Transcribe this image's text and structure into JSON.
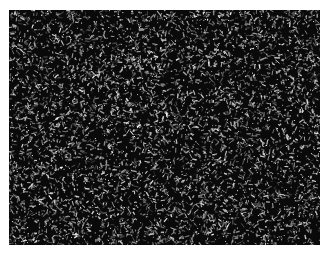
{
  "figure": {
    "colors": {
      "background": "#0a0a0a",
      "speckle_light": "#e6e6e6",
      "speckle_mid": "#8a8a8a"
    }
  },
  "caption": {
    "text": ""
  }
}
